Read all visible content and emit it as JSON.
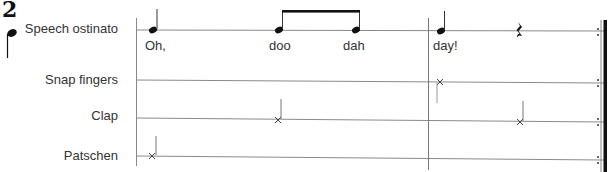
{
  "exercise": {
    "number": "2",
    "beat_symbol": "quarter-note-icon"
  },
  "parts": [
    {
      "label": "Speech ostinato",
      "y": 30
    },
    {
      "label": "Snap fingers",
      "y": 81
    },
    {
      "label": "Clap",
      "y": 119
    },
    {
      "label": "Patschen",
      "y": 157
    }
  ],
  "lyrics": [
    {
      "text": "Oh,",
      "x": 145
    },
    {
      "text": "doo",
      "x": 269
    },
    {
      "text": "dah",
      "x": 343
    },
    {
      "text": "day!",
      "x": 433
    }
  ],
  "notation": {
    "speech": [
      "quarter",
      "eighth",
      "eighth",
      "quarter",
      "quarter-rest"
    ],
    "snap_fingers": [
      "x-note at beat 3"
    ],
    "clap": [
      "x-note at beat 2",
      "x-note at beat 4"
    ],
    "patschen": [
      "x-note at beat 1"
    ],
    "end_barline": "repeat"
  },
  "colors": {
    "ink": "#111111",
    "line": "#888888",
    "text": "#333333"
  }
}
